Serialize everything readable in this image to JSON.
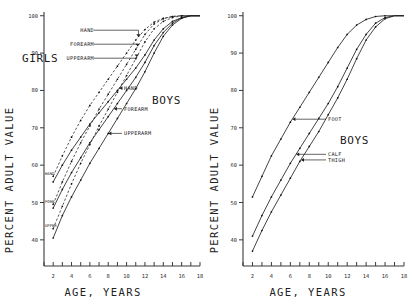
{
  "figure": {
    "background": "#ffffff",
    "ink": "#222222"
  },
  "panels": [
    {
      "id": "left",
      "group_labels": [
        {
          "text": "GIRLS",
          "x": 18,
          "y": 58
        },
        {
          "text": "BOYS",
          "x": 120,
          "y": 100
        }
      ]
    },
    {
      "id": "right",
      "group_labels": [
        {
          "text": "BOYS",
          "x": 126,
          "y": 140
        }
      ]
    }
  ],
  "axis": {
    "xlabel": "AGE, YEARS",
    "ylabel": "PERCENT ADULT VALUE",
    "xticks": [
      1,
      2,
      3,
      4,
      5,
      6,
      7,
      8,
      9,
      10,
      11,
      12,
      13,
      14,
      15,
      16,
      17,
      18
    ],
    "xticklabels": [
      "",
      "2",
      "",
      "4",
      "",
      "6",
      "",
      "8",
      "",
      "10",
      "",
      "12",
      "",
      "14",
      "",
      "16",
      "",
      "18"
    ],
    "yticks": [
      40,
      50,
      60,
      70,
      80,
      90,
      100
    ],
    "yticklabels": [
      "40",
      "50",
      "60",
      "70",
      "80",
      "90",
      "100"
    ],
    "xlim": [
      1,
      18
    ],
    "ylim": [
      33,
      101
    ],
    "grid": false
  },
  "chart_data": [
    {
      "type": "line",
      "title": "",
      "subtitle": "Upper limb segments",
      "xlabel": "AGE, YEARS",
      "ylabel": "PERCENT ADULT VALUE",
      "xlim": [
        1,
        18
      ],
      "ylim": [
        33,
        101
      ],
      "grid": false,
      "legend_position": "inline-annotations",
      "x": [
        2,
        3,
        4,
        5,
        6,
        7,
        8,
        9,
        10,
        11,
        12,
        13,
        14,
        15,
        16,
        17,
        18
      ],
      "series": [
        {
          "name": "HAND",
          "group": "GIRLS",
          "style": "dashed",
          "annotation": "HAND",
          "mini_annotation": "HAND",
          "values": [
            57.0,
            62.5,
            67.5,
            72.0,
            76.0,
            79.5,
            83.0,
            86.5,
            90.0,
            93.5,
            96.3,
            98.3,
            99.3,
            99.8,
            100.0,
            100.0,
            100.0
          ]
        },
        {
          "name": "FOREARM",
          "group": "GIRLS",
          "style": "dashed",
          "annotation": "FOREARM",
          "mini_annotation": "FORE",
          "values": [
            49.5,
            55.5,
            61.0,
            66.0,
            70.5,
            75.0,
            79.0,
            83.0,
            87.0,
            91.0,
            95.0,
            97.8,
            99.2,
            99.8,
            100.0,
            100.0,
            100.0
          ]
        },
        {
          "name": "UPPERARM",
          "group": "GIRLS",
          "style": "dashed",
          "annotation": "UPPERARM",
          "mini_annotation": "UPPER",
          "values": [
            43.0,
            49.0,
            55.0,
            60.5,
            65.5,
            70.5,
            75.0,
            79.5,
            84.0,
            88.5,
            93.0,
            96.5,
            98.5,
            99.5,
            100.0,
            100.0,
            100.0
          ]
        },
        {
          "name": "HAND",
          "group": "BOYS",
          "style": "solid",
          "annotation": "HAND",
          "mini_annotation": "HAND",
          "values": [
            55.5,
            60.0,
            64.0,
            67.5,
            71.0,
            74.0,
            77.0,
            80.0,
            83.0,
            86.0,
            89.5,
            93.5,
            96.5,
            98.5,
            99.5,
            100.0,
            100.0
          ]
        },
        {
          "name": "FOREARM",
          "group": "BOYS",
          "style": "solid",
          "annotation": "FOREARM",
          "mini_annotation": "FORE",
          "values": [
            48.5,
            53.5,
            58.0,
            62.0,
            66.0,
            69.5,
            73.0,
            76.5,
            80.0,
            83.5,
            87.5,
            92.0,
            95.5,
            98.0,
            99.5,
            100.0,
            100.0
          ]
        },
        {
          "name": "UPPERARM",
          "group": "BOYS",
          "style": "solid",
          "annotation": "UPPERARM",
          "mini_annotation": "UPPER",
          "values": [
            40.5,
            46.5,
            51.5,
            56.0,
            60.5,
            64.5,
            68.5,
            72.5,
            76.5,
            80.5,
            85.0,
            90.0,
            94.5,
            97.5,
            99.3,
            100.0,
            100.0
          ]
        }
      ]
    },
    {
      "type": "line",
      "title": "",
      "subtitle": "Lower limb segments",
      "xlabel": "AGE, YEARS",
      "ylabel": "PERCENT ADULT VALUE",
      "xlim": [
        1,
        18
      ],
      "ylim": [
        33,
        101
      ],
      "grid": false,
      "legend_position": "inline-annotations",
      "x": [
        2,
        3,
        4,
        5,
        6,
        7,
        8,
        9,
        10,
        11,
        12,
        13,
        14,
        15,
        16,
        17,
        18
      ],
      "series": [
        {
          "name": "FOOT",
          "group": "BOYS",
          "style": "solid",
          "annotation": "FOOT",
          "values": [
            51.5,
            57.0,
            62.5,
            67.0,
            71.5,
            75.5,
            79.5,
            83.5,
            87.5,
            91.5,
            95.0,
            97.5,
            99.0,
            99.8,
            100.0,
            100.0,
            100.0
          ]
        },
        {
          "name": "CALF",
          "group": "BOYS",
          "style": "solid",
          "annotation": "CALF",
          "values": [
            41.0,
            46.5,
            51.5,
            56.0,
            60.5,
            64.5,
            68.5,
            72.5,
            76.5,
            81.0,
            86.0,
            91.0,
            95.0,
            98.0,
            99.5,
            100.0,
            100.0
          ]
        },
        {
          "name": "THIGH",
          "group": "BOYS",
          "style": "solid",
          "annotation": "THIGH",
          "values": [
            37.0,
            42.5,
            47.5,
            52.0,
            56.5,
            61.0,
            65.0,
            69.0,
            73.5,
            78.0,
            83.0,
            88.5,
            93.5,
            97.0,
            99.2,
            100.0,
            100.0
          ]
        }
      ]
    }
  ]
}
